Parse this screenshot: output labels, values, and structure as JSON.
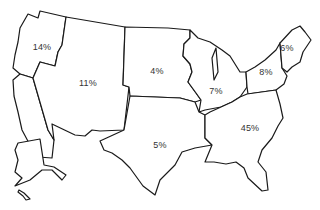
{
  "map": {
    "type": "choropleth-outline",
    "subject": "United States regions",
    "regions": [
      {
        "id": "pacific-northwest",
        "label": "14%",
        "x": 42,
        "y": 47
      },
      {
        "id": "mountain-west",
        "label": "11%",
        "x": 88,
        "y": 83
      },
      {
        "id": "north-central",
        "label": "4%",
        "x": 157,
        "y": 71
      },
      {
        "id": "great-lakes",
        "label": "7%",
        "x": 216,
        "y": 91
      },
      {
        "id": "mid-atlantic",
        "label": "8%",
        "x": 266,
        "y": 72
      },
      {
        "id": "new-england",
        "label": "6%",
        "x": 287,
        "y": 48
      },
      {
        "id": "south-central",
        "label": "5%",
        "x": 160,
        "y": 145
      },
      {
        "id": "southeast",
        "label": "45%",
        "x": 250,
        "y": 128
      }
    ]
  }
}
